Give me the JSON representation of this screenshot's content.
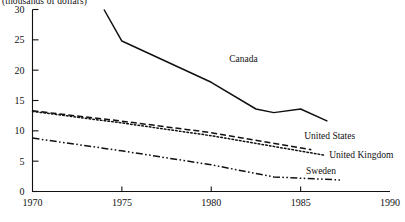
{
  "chart_data": {
    "type": "line",
    "title": "",
    "subtitle": "",
    "unit_label": "(thousands of dollars)",
    "xlabel": "",
    "ylabel": "",
    "xlim": [
      1970,
      1990
    ],
    "ylim": [
      0,
      30
    ],
    "xticks": [
      1970,
      1975,
      1980,
      1985,
      1990
    ],
    "yticks": [
      0,
      5,
      10,
      15,
      20,
      25,
      30
    ],
    "grid": false,
    "legend_position": "inline-right",
    "series": [
      {
        "name": "Canada",
        "style": "solid",
        "label_x": 1981.0,
        "label_y": 21.4,
        "x": [
          1974.0,
          1975.0,
          1980.0,
          1982.5,
          1983.5,
          1985.0,
          1986.5
        ],
        "values": [
          30.0,
          24.8,
          18.0,
          13.6,
          13.0,
          13.6,
          11.6
        ]
      },
      {
        "name": "United States",
        "style": "dashed",
        "label_x": 1985.2,
        "label_y": 8.6,
        "x": [
          1970.0,
          1975.0,
          1980.0,
          1985.6
        ],
        "values": [
          13.3,
          11.6,
          9.7,
          6.9
        ]
      },
      {
        "name": "United Kingdom",
        "style": "dotted",
        "label_x": 1986.6,
        "label_y": 5.6,
        "x": [
          1970.0,
          1975.0,
          1980.0,
          1986.3
        ],
        "values": [
          13.2,
          11.3,
          9.2,
          6.0
        ]
      },
      {
        "name": "Sweden",
        "style": "dash-dot-dot",
        "label_x": 1985.3,
        "label_y": 2.9,
        "x": [
          1970.0,
          1975.0,
          1980.0,
          1983.5,
          1987.2
        ],
        "values": [
          8.8,
          6.7,
          4.4,
          2.4,
          1.9
        ]
      }
    ]
  }
}
